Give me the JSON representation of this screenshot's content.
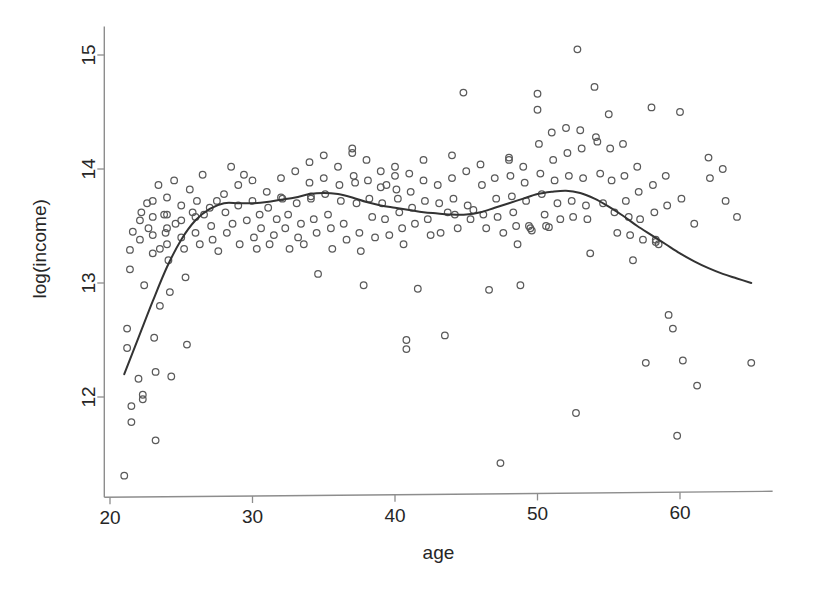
{
  "chart_data": {
    "type": "scatter",
    "title": "",
    "subtitle": "",
    "xlabel": "age",
    "ylabel": "log(income)",
    "xlim": [
      19.6,
      66.5
    ],
    "ylim": [
      11.12,
      15.25
    ],
    "xticks": [
      20,
      30,
      40,
      50,
      60
    ],
    "xtick_labels": [
      "20",
      "30",
      "40",
      "50",
      "60"
    ],
    "yticks": [
      12,
      13,
      14,
      15
    ],
    "ytick_labels": [
      "12",
      "13",
      "14",
      "15"
    ],
    "grid": false,
    "legend": false,
    "legend_position": "none",
    "marker": "open-circle",
    "marker_color": "#5a5a5a",
    "curve_color": "#333333",
    "axis_color": "#8d8d8d",
    "background_color": "#ffffff",
    "series": [
      {
        "name": "observations",
        "type": "scatter",
        "points": [
          [
            21.0,
            11.31
          ],
          [
            21.2,
            12.6
          ],
          [
            21.2,
            12.43
          ],
          [
            21.4,
            13.29
          ],
          [
            21.4,
            13.12
          ],
          [
            21.5,
            11.92
          ],
          [
            21.5,
            11.78
          ],
          [
            21.6,
            13.45
          ],
          [
            22.0,
            12.16
          ],
          [
            22.1,
            13.55
          ],
          [
            22.1,
            13.38
          ],
          [
            22.2,
            13.62
          ],
          [
            22.3,
            12.02
          ],
          [
            22.3,
            11.98
          ],
          [
            22.4,
            12.98
          ],
          [
            22.6,
            13.7
          ],
          [
            22.7,
            13.48
          ],
          [
            23.0,
            13.72
          ],
          [
            23.0,
            13.58
          ],
          [
            23.0,
            13.42
          ],
          [
            23.0,
            13.26
          ],
          [
            23.1,
            12.52
          ],
          [
            23.2,
            12.22
          ],
          [
            23.2,
            11.62
          ],
          [
            23.4,
            13.86
          ],
          [
            23.5,
            13.3
          ],
          [
            23.5,
            12.8
          ],
          [
            23.8,
            13.6
          ],
          [
            23.9,
            13.44
          ],
          [
            24.0,
            13.75
          ],
          [
            24.0,
            13.6
          ],
          [
            24.0,
            13.48
          ],
          [
            24.0,
            13.34
          ],
          [
            24.1,
            13.2
          ],
          [
            24.2,
            12.92
          ],
          [
            24.3,
            12.18
          ],
          [
            24.5,
            13.9
          ],
          [
            24.6,
            13.52
          ],
          [
            25.0,
            13.68
          ],
          [
            25.0,
            13.55
          ],
          [
            25.0,
            13.4
          ],
          [
            25.2,
            13.3
          ],
          [
            25.3,
            13.05
          ],
          [
            25.4,
            12.46
          ],
          [
            25.6,
            13.82
          ],
          [
            25.8,
            13.62
          ],
          [
            26.0,
            13.58
          ],
          [
            26.0,
            13.44
          ],
          [
            26.1,
            13.72
          ],
          [
            26.3,
            13.34
          ],
          [
            26.5,
            13.95
          ],
          [
            26.6,
            13.6
          ],
          [
            27.0,
            13.66
          ],
          [
            27.1,
            13.5
          ],
          [
            27.2,
            13.38
          ],
          [
            27.5,
            13.72
          ],
          [
            27.6,
            13.28
          ],
          [
            28.0,
            13.78
          ],
          [
            28.1,
            13.62
          ],
          [
            28.2,
            13.44
          ],
          [
            28.5,
            14.02
          ],
          [
            28.6,
            13.52
          ],
          [
            29.0,
            13.86
          ],
          [
            29.0,
            13.68
          ],
          [
            29.1,
            13.34
          ],
          [
            29.4,
            13.95
          ],
          [
            29.6,
            13.55
          ],
          [
            30.0,
            13.9
          ],
          [
            30.0,
            13.72
          ],
          [
            30.1,
            13.4
          ],
          [
            30.3,
            13.3
          ],
          [
            30.5,
            13.6
          ],
          [
            30.6,
            13.48
          ],
          [
            31.0,
            13.8
          ],
          [
            31.1,
            13.66
          ],
          [
            31.2,
            13.34
          ],
          [
            31.5,
            13.42
          ],
          [
            31.7,
            13.56
          ],
          [
            32.0,
            13.92
          ],
          [
            32.0,
            13.75
          ],
          [
            32.1,
            13.74
          ],
          [
            32.3,
            13.48
          ],
          [
            32.5,
            13.6
          ],
          [
            32.6,
            13.3
          ],
          [
            33.0,
            13.98
          ],
          [
            33.1,
            13.7
          ],
          [
            33.2,
            13.4
          ],
          [
            33.4,
            13.52
          ],
          [
            33.6,
            13.34
          ],
          [
            34.0,
            14.06
          ],
          [
            34.0,
            13.88
          ],
          [
            34.1,
            13.76
          ],
          [
            34.1,
            13.74
          ],
          [
            34.3,
            13.56
          ],
          [
            34.5,
            13.44
          ],
          [
            34.6,
            13.08
          ],
          [
            35.0,
            14.12
          ],
          [
            35.0,
            13.92
          ],
          [
            35.1,
            13.78
          ],
          [
            35.3,
            13.6
          ],
          [
            35.5,
            13.48
          ],
          [
            35.6,
            13.3
          ],
          [
            36.0,
            14.02
          ],
          [
            36.1,
            13.86
          ],
          [
            36.2,
            13.72
          ],
          [
            36.4,
            13.52
          ],
          [
            36.6,
            13.38
          ],
          [
            37.0,
            14.18
          ],
          [
            37.0,
            14.14
          ],
          [
            37.1,
            13.94
          ],
          [
            37.2,
            13.88
          ],
          [
            37.3,
            13.7
          ],
          [
            37.5,
            13.44
          ],
          [
            37.6,
            13.28
          ],
          [
            37.8,
            12.98
          ],
          [
            38.0,
            14.08
          ],
          [
            38.1,
            13.9
          ],
          [
            38.2,
            13.74
          ],
          [
            38.4,
            13.58
          ],
          [
            38.6,
            13.4
          ],
          [
            39.0,
            13.98
          ],
          [
            39.0,
            13.84
          ],
          [
            39.1,
            13.7
          ],
          [
            39.3,
            13.56
          ],
          [
            39.4,
            13.86
          ],
          [
            39.6,
            13.42
          ],
          [
            40.0,
            14.02
          ],
          [
            40.0,
            13.94
          ],
          [
            40.1,
            13.82
          ],
          [
            40.2,
            13.74
          ],
          [
            40.3,
            13.62
          ],
          [
            40.5,
            13.48
          ],
          [
            40.6,
            13.34
          ],
          [
            40.8,
            12.5
          ],
          [
            40.8,
            12.42
          ],
          [
            41.0,
            13.96
          ],
          [
            41.1,
            13.8
          ],
          [
            41.2,
            13.66
          ],
          [
            41.4,
            13.52
          ],
          [
            41.6,
            12.95
          ],
          [
            42.0,
            14.08
          ],
          [
            42.0,
            13.9
          ],
          [
            42.1,
            13.72
          ],
          [
            42.3,
            13.56
          ],
          [
            42.5,
            13.42
          ],
          [
            43.0,
            13.86
          ],
          [
            43.1,
            13.7
          ],
          [
            43.2,
            13.44
          ],
          [
            43.5,
            12.54
          ],
          [
            43.7,
            13.62
          ],
          [
            44.0,
            14.12
          ],
          [
            44.0,
            13.92
          ],
          [
            44.1,
            13.74
          ],
          [
            44.2,
            13.6
          ],
          [
            44.4,
            13.48
          ],
          [
            44.8,
            14.67
          ],
          [
            45.0,
            13.98
          ],
          [
            45.1,
            13.68
          ],
          [
            45.3,
            13.56
          ],
          [
            45.5,
            13.64
          ],
          [
            46.0,
            14.04
          ],
          [
            46.1,
            13.86
          ],
          [
            46.2,
            13.6
          ],
          [
            46.4,
            13.48
          ],
          [
            46.6,
            12.94
          ],
          [
            47.0,
            13.92
          ],
          [
            47.1,
            13.74
          ],
          [
            47.2,
            13.58
          ],
          [
            47.4,
            11.42
          ],
          [
            47.6,
            13.44
          ],
          [
            48.0,
            14.1
          ],
          [
            48.0,
            14.08
          ],
          [
            48.1,
            13.94
          ],
          [
            48.2,
            13.76
          ],
          [
            48.3,
            13.62
          ],
          [
            48.5,
            13.5
          ],
          [
            48.6,
            13.34
          ],
          [
            48.8,
            12.98
          ],
          [
            49.0,
            14.02
          ],
          [
            49.1,
            13.88
          ],
          [
            49.2,
            13.72
          ],
          [
            49.4,
            13.5
          ],
          [
            49.5,
            13.48
          ],
          [
            49.6,
            13.46
          ],
          [
            50.0,
            14.66
          ],
          [
            50.0,
            14.52
          ],
          [
            50.1,
            14.22
          ],
          [
            50.2,
            13.96
          ],
          [
            50.3,
            13.78
          ],
          [
            50.5,
            13.6
          ],
          [
            50.6,
            13.5
          ],
          [
            50.8,
            13.49
          ],
          [
            51.0,
            14.32
          ],
          [
            51.1,
            14.08
          ],
          [
            51.2,
            13.9
          ],
          [
            51.4,
            13.7
          ],
          [
            51.6,
            13.56
          ],
          [
            52.0,
            14.36
          ],
          [
            52.1,
            14.14
          ],
          [
            52.2,
            13.94
          ],
          [
            52.4,
            13.72
          ],
          [
            52.5,
            13.58
          ],
          [
            52.7,
            11.86
          ],
          [
            52.8,
            15.05
          ],
          [
            53.0,
            14.34
          ],
          [
            53.1,
            14.18
          ],
          [
            53.2,
            13.92
          ],
          [
            53.4,
            13.68
          ],
          [
            53.5,
            13.56
          ],
          [
            53.7,
            13.26
          ],
          [
            54.0,
            14.72
          ],
          [
            54.1,
            14.28
          ],
          [
            54.2,
            14.24
          ],
          [
            54.4,
            13.96
          ],
          [
            54.6,
            13.7
          ],
          [
            55.0,
            14.48
          ],
          [
            55.1,
            14.18
          ],
          [
            55.2,
            13.9
          ],
          [
            55.4,
            13.62
          ],
          [
            55.6,
            13.44
          ],
          [
            56.0,
            14.22
          ],
          [
            56.1,
            13.94
          ],
          [
            56.2,
            13.72
          ],
          [
            56.4,
            13.58
          ],
          [
            56.5,
            13.42
          ],
          [
            56.7,
            13.2
          ],
          [
            57.0,
            14.02
          ],
          [
            57.1,
            13.8
          ],
          [
            57.2,
            13.56
          ],
          [
            57.4,
            13.38
          ],
          [
            57.6,
            12.3
          ],
          [
            58.0,
            14.54
          ],
          [
            58.1,
            13.86
          ],
          [
            58.2,
            13.62
          ],
          [
            58.3,
            13.38
          ],
          [
            58.3,
            13.36
          ],
          [
            58.5,
            13.34
          ],
          [
            59.0,
            13.94
          ],
          [
            59.1,
            13.68
          ],
          [
            59.2,
            12.72
          ],
          [
            59.5,
            12.6
          ],
          [
            59.8,
            11.66
          ],
          [
            60.0,
            14.5
          ],
          [
            60.1,
            13.74
          ],
          [
            60.2,
            12.32
          ],
          [
            61.0,
            13.52
          ],
          [
            61.2,
            12.1
          ],
          [
            62.0,
            14.1
          ],
          [
            62.1,
            13.92
          ],
          [
            63.0,
            14.0
          ],
          [
            63.2,
            13.72
          ],
          [
            64.0,
            13.58
          ],
          [
            65.0,
            12.3
          ]
        ]
      },
      {
        "name": "smooth-fit",
        "type": "line",
        "points": [
          [
            21.0,
            12.2
          ],
          [
            22.0,
            12.52
          ],
          [
            23.0,
            12.84
          ],
          [
            24.0,
            13.14
          ],
          [
            25.0,
            13.38
          ],
          [
            26.0,
            13.55
          ],
          [
            27.0,
            13.65
          ],
          [
            28.0,
            13.7
          ],
          [
            29.0,
            13.7
          ],
          [
            30.0,
            13.7
          ],
          [
            31.0,
            13.71
          ],
          [
            32.0,
            13.73
          ],
          [
            33.0,
            13.75
          ],
          [
            34.0,
            13.78
          ],
          [
            35.0,
            13.79
          ],
          [
            36.0,
            13.78
          ],
          [
            37.0,
            13.75
          ],
          [
            38.0,
            13.71
          ],
          [
            39.0,
            13.68
          ],
          [
            40.0,
            13.66
          ],
          [
            41.0,
            13.64
          ],
          [
            42.0,
            13.62
          ],
          [
            43.0,
            13.61
          ],
          [
            44.0,
            13.6
          ],
          [
            45.0,
            13.6
          ],
          [
            46.0,
            13.62
          ],
          [
            47.0,
            13.66
          ],
          [
            48.0,
            13.7
          ],
          [
            49.0,
            13.74
          ],
          [
            50.0,
            13.78
          ],
          [
            51.0,
            13.8
          ],
          [
            52.0,
            13.81
          ],
          [
            53.0,
            13.79
          ],
          [
            54.0,
            13.74
          ],
          [
            55.0,
            13.67
          ],
          [
            56.0,
            13.59
          ],
          [
            57.0,
            13.5
          ],
          [
            58.0,
            13.42
          ],
          [
            59.0,
            13.34
          ],
          [
            60.0,
            13.26
          ],
          [
            61.0,
            13.19
          ],
          [
            62.0,
            13.13
          ],
          [
            63.0,
            13.08
          ],
          [
            64.0,
            13.04
          ],
          [
            65.0,
            13.0
          ]
        ]
      }
    ]
  }
}
